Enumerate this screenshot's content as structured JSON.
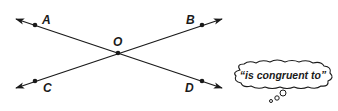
{
  "diagram": {
    "points": [
      {
        "name": "A",
        "label": "A",
        "x": 35,
        "y": 25
      },
      {
        "name": "B",
        "label": "B",
        "x": 202,
        "y": 25
      },
      {
        "name": "O",
        "label": "O",
        "x": 118,
        "y": 53
      },
      {
        "name": "C",
        "label": "C",
        "x": 35,
        "y": 81
      },
      {
        "name": "D",
        "label": "D",
        "x": 202,
        "y": 81
      }
    ],
    "lines": [
      {
        "name": "line-AD",
        "through": [
          "A",
          "O",
          "D"
        ]
      },
      {
        "name": "line-CB",
        "through": [
          "C",
          "O",
          "B"
        ]
      }
    ],
    "thought_bubble": {
      "text": "“is congruent to”"
    },
    "colors": {
      "stroke": "#1a1a1a",
      "background": "#ffffff"
    }
  }
}
